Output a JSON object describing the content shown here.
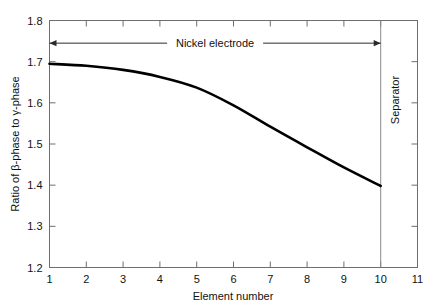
{
  "chart_data": {
    "type": "line",
    "title": "",
    "xlabel": "Element number",
    "ylabel": "Ratio of β-phase to γ-phase",
    "xlim": [
      1,
      11
    ],
    "ylim": [
      1.2,
      1.8
    ],
    "xticks": [
      "1",
      "2",
      "3",
      "4",
      "5",
      "6",
      "7",
      "8",
      "9",
      "10",
      "11"
    ],
    "yticks": [
      "1.2",
      "1.3",
      "1.4",
      "1.5",
      "1.6",
      "1.7",
      "1.8"
    ],
    "grid": false,
    "legend": false,
    "x": [
      1,
      2,
      3,
      4,
      5,
      6,
      7,
      8,
      9,
      10
    ],
    "values": [
      1.695,
      1.69,
      1.68,
      1.663,
      1.637,
      1.594,
      1.542,
      1.492,
      1.443,
      1.398
    ],
    "series": [
      {
        "name": "Ratio of β-phase to γ-phase",
        "color": "#000000",
        "values": [
          1.695,
          1.69,
          1.68,
          1.663,
          1.637,
          1.594,
          1.542,
          1.492,
          1.443,
          1.398
        ]
      }
    ],
    "annotations": [
      {
        "label": "Nickel electrode",
        "type": "double-arrow-span",
        "x_start": 1,
        "x_end": 10,
        "y": 1.745
      },
      {
        "label": "Separator",
        "type": "region-label-vertical",
        "x_start": 10,
        "x_end": 11
      },
      {
        "label": "",
        "type": "vertical-divider",
        "x": 10
      }
    ]
  },
  "axes": {
    "x_title": "Element number",
    "y_title": "Ratio of β-phase to γ-phase",
    "x_tick_labels": [
      "1",
      "2",
      "3",
      "4",
      "5",
      "6",
      "7",
      "8",
      "9",
      "10",
      "11"
    ],
    "y_tick_labels": [
      "1.2",
      "1.3",
      "1.4",
      "1.5",
      "1.6",
      "1.7",
      "1.8"
    ]
  },
  "annotations": {
    "nickel_electrode": "Nickel electrode",
    "separator": "Separator"
  },
  "colors": {
    "curve": "#000000",
    "frame": "#6e6e6e",
    "separator": "#8a8a8a",
    "annotation": "#2a2a2a",
    "background": "#ffffff"
  }
}
